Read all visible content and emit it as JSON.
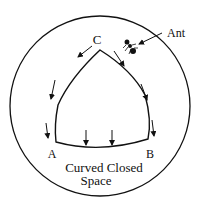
{
  "diagram": {
    "labels": {
      "vertex_a": "A",
      "vertex_b": "B",
      "vertex_c": "C",
      "ant": "Ant",
      "caption_line1": "Curved Closed",
      "caption_line2": "Space"
    },
    "colors": {
      "stroke": "#111111",
      "background": "#ffffff"
    }
  }
}
